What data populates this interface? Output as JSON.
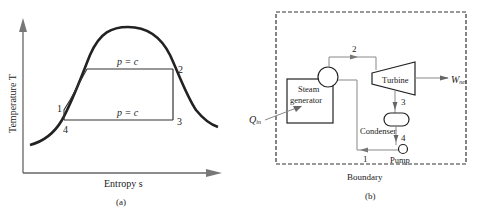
{
  "panel_a": {
    "caption": "(a)",
    "x_axis_label": "Entropy s",
    "y_axis_label": "Temperature T",
    "isobar_high_label": "p = c",
    "isobar_low_label": "p = c",
    "state_labels": {
      "s1": "1",
      "s2": "2",
      "s3": "3",
      "s4": "4"
    }
  },
  "panel_b": {
    "caption": "(b)",
    "boundary_label": "Boundary",
    "components": {
      "steam_generator_line1": "Steam",
      "steam_generator_line2": "generator",
      "turbine": "Turbine",
      "condenser": "Condenser",
      "pump": "Pump"
    },
    "flows": {
      "heat_in": "Q",
      "heat_in_sub": "in",
      "work_out": "W",
      "work_out_sub": "net"
    },
    "state_labels": {
      "s1": "1",
      "s2": "2",
      "s3": "3",
      "s4": "4"
    }
  },
  "colors": {
    "line": "#222222",
    "flow_line": "#666666",
    "boundary": "#333333"
  }
}
